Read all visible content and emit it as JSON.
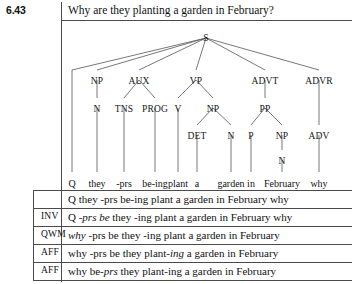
{
  "exercise": {
    "number": "6.43"
  },
  "prompt": {
    "text": "Why are they planting a garden in February?"
  },
  "tree": {
    "root": "S",
    "nodes": [
      {
        "label": "S",
        "x": 206,
        "y": 33
      },
      {
        "label": "NP",
        "x": 97,
        "y": 76
      },
      {
        "label": "AUX",
        "x": 139,
        "y": 76
      },
      {
        "label": "VP",
        "x": 196,
        "y": 76
      },
      {
        "label": "ADVT",
        "x": 265,
        "y": 76
      },
      {
        "label": "ADVR",
        "x": 319,
        "y": 76
      },
      {
        "label": "N",
        "x": 97,
        "y": 104
      },
      {
        "label": "TNS",
        "x": 124,
        "y": 104
      },
      {
        "label": "PROG",
        "x": 155,
        "y": 104
      },
      {
        "label": "V",
        "x": 178,
        "y": 104
      },
      {
        "label": "NP",
        "x": 213,
        "y": 104
      },
      {
        "label": "PP",
        "x": 265,
        "y": 104
      },
      {
        "label": "DET",
        "x": 197,
        "y": 131
      },
      {
        "label": "N",
        "x": 231,
        "y": 131
      },
      {
        "label": "P",
        "x": 251,
        "y": 131
      },
      {
        "label": "NP",
        "x": 282,
        "y": 131
      },
      {
        "label": "ADV",
        "x": 319,
        "y": 131
      },
      {
        "label": "N",
        "x": 282,
        "y": 156
      }
    ],
    "words": [
      {
        "text": "Q",
        "x": 72,
        "y": 178
      },
      {
        "text": "they",
        "x": 97,
        "y": 178
      },
      {
        "text": "-prs",
        "x": 124,
        "y": 178
      },
      {
        "text": "be-ing",
        "x": 155,
        "y": 178
      },
      {
        "text": "plant",
        "x": 178,
        "y": 178
      },
      {
        "text": "a",
        "x": 197,
        "y": 178
      },
      {
        "text": "garden",
        "x": 231,
        "y": 178
      },
      {
        "text": "in",
        "x": 251,
        "y": 178
      },
      {
        "text": "February",
        "x": 282,
        "y": 178
      },
      {
        "text": "why",
        "x": 319,
        "y": 178
      }
    ],
    "edges": [
      [
        206,
        38,
        72,
        70
      ],
      [
        206,
        38,
        97,
        70
      ],
      [
        206,
        38,
        139,
        70
      ],
      [
        206,
        38,
        196,
        70
      ],
      [
        206,
        38,
        265,
        70
      ],
      [
        206,
        38,
        319,
        70
      ],
      [
        72,
        70,
        72,
        172
      ],
      [
        97,
        80,
        97,
        98
      ],
      [
        139,
        80,
        124,
        98
      ],
      [
        139,
        80,
        155,
        98
      ],
      [
        196,
        80,
        178,
        98
      ],
      [
        196,
        80,
        213,
        98
      ],
      [
        265,
        80,
        265,
        98
      ],
      [
        319,
        80,
        319,
        125
      ],
      [
        97,
        108,
        97,
        172
      ],
      [
        124,
        108,
        124,
        172
      ],
      [
        155,
        108,
        155,
        172
      ],
      [
        178,
        108,
        178,
        172
      ],
      [
        213,
        108,
        197,
        125
      ],
      [
        213,
        108,
        231,
        125
      ],
      [
        265,
        108,
        251,
        125
      ],
      [
        265,
        108,
        282,
        125
      ],
      [
        197,
        135,
        197,
        172
      ],
      [
        231,
        135,
        231,
        172
      ],
      [
        251,
        135,
        251,
        172
      ],
      [
        282,
        135,
        282,
        150
      ],
      [
        319,
        135,
        319,
        172
      ],
      [
        282,
        160,
        282,
        172
      ]
    ]
  },
  "table": {
    "rows": [
      {
        "label": "",
        "y": 193,
        "segments": [
          {
            "t": "Q they -prs be-ing plant a garden in February why",
            "i": false
          }
        ]
      },
      {
        "label": "INV",
        "y": 211,
        "segments": [
          {
            "t": "Q ",
            "i": false
          },
          {
            "t": "-prs be",
            "i": true
          },
          {
            "t": " they -ing plant a garden in February why",
            "i": false
          }
        ]
      },
      {
        "label": "QWM",
        "y": 229,
        "segments": [
          {
            "t": "why",
            "i": true
          },
          {
            "t": " -prs be they -ing plant a garden in February",
            "i": false
          }
        ]
      },
      {
        "label": "AFF",
        "y": 247,
        "segments": [
          {
            "t": "why -prs be they plant-",
            "i": false
          },
          {
            "t": "ing",
            "i": true
          },
          {
            "t": " a garden in February",
            "i": false
          }
        ]
      },
      {
        "label": "AFF",
        "y": 265,
        "segments": [
          {
            "t": "why be-",
            "i": false
          },
          {
            "t": "prs",
            "i": true
          },
          {
            "t": " they plant-ing a garden in February",
            "i": false
          }
        ]
      }
    ],
    "rules_y": [
      20,
      190,
      208,
      226,
      244,
      262,
      280
    ],
    "label_x": 41
  },
  "colors": {
    "rule": "#4a4a4a",
    "text": "#111111",
    "tree_line": "#555555"
  }
}
